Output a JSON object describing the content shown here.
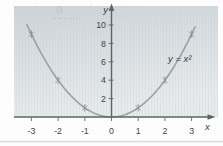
{
  "chart_data": {
    "type": "line",
    "title": "",
    "equation_label": "y = x²",
    "function": "y = x^2",
    "xlabel": "x",
    "ylabel": "y",
    "x_ticks": [
      -3,
      -2,
      -1,
      0,
      1,
      2,
      3
    ],
    "y_ticks": [
      2,
      4,
      6,
      8,
      10
    ],
    "xlim": [
      -3.7,
      4.0
    ],
    "ylim": [
      0,
      12
    ],
    "curve_domain": [
      -3.17,
      3.17
    ],
    "marked_points": [
      [
        -3,
        9
      ],
      [
        -2,
        4
      ],
      [
        -1,
        1
      ],
      [
        1,
        1
      ],
      [
        2,
        4
      ],
      [
        3,
        9
      ]
    ],
    "marker_style": "asterisk-star",
    "grid": false,
    "legend": "none"
  },
  "figure": {
    "colors": {
      "page_bg": "#fdfdfd",
      "plot_bg_top": "#ccd4d8",
      "plot_bg_bottom": "#e8ebec",
      "stripe": "#c3cdd1",
      "curve": "#9aa1a4",
      "marker": "#8a9194",
      "axis": "#5d6466",
      "tick_text": "#3f4547",
      "equation_text": "#3b4143",
      "page_rule": "#d8dbdc",
      "ghost": "#8f969a"
    }
  },
  "artifacts": {
    "ghost_mark_left": "'",
    "ghost_zero": "0",
    "ghost_mark_right": "/"
  }
}
